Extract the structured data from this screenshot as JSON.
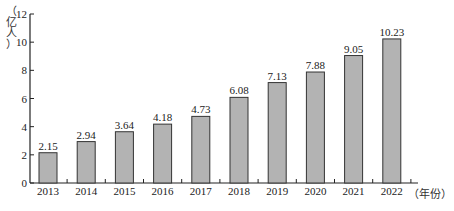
{
  "chart_data": {
    "type": "bar",
    "title": "",
    "xlabel": "（年份）",
    "ylabel": "（亿人）",
    "categories": [
      "2013",
      "2014",
      "2015",
      "2016",
      "2017",
      "2018",
      "2019",
      "2020",
      "2021",
      "2022"
    ],
    "values": [
      2.15,
      2.94,
      3.64,
      4.18,
      4.73,
      6.08,
      7.13,
      7.88,
      9.05,
      10.23
    ],
    "data_labels": [
      "2.15",
      "2.94",
      "3.64",
      "4.18",
      "4.73",
      "6.08",
      "7.13",
      "7.88",
      "9.05",
      "10.23"
    ],
    "ylim": [
      0,
      12
    ],
    "yticks": [
      0,
      2,
      4,
      6,
      8,
      10,
      12
    ],
    "grid": false,
    "legend": null,
    "bar_color": "#b3b3b3",
    "bar_edge_color": "#333333"
  },
  "labels": {
    "y_unit_chars": [
      "（",
      "亿",
      "人",
      "）"
    ],
    "x_unit": "（年份）"
  }
}
